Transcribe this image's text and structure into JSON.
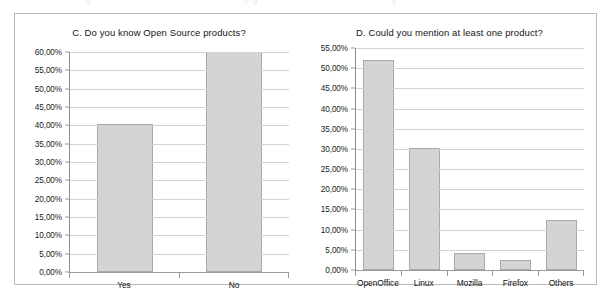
{
  "figure": {
    "cropped_top_fragments": [
      "g",
      "p g",
      "y"
    ]
  },
  "chart_data": [
    {
      "id": "chart-c",
      "type": "bar",
      "title": "C. Do you know Open Source products?",
      "xlabel": "",
      "ylabel": "",
      "categories": [
        "Yes",
        "No"
      ],
      "values": [
        40.5,
        60.0
      ],
      "value_labels": [
        "40,50%",
        "60,00%"
      ],
      "ylim": [
        0,
        60
      ],
      "ytick_step": 5,
      "ytick_labels": [
        "60,00%",
        "55,00%",
        "50,00%",
        "45,00%",
        "40,00%",
        "35,00%",
        "30,00%",
        "25,00%",
        "20,00%",
        "15,00%",
        "10,00%",
        "5,00%",
        "0,00%"
      ],
      "ytick_values": [
        60,
        55,
        50,
        45,
        40,
        35,
        30,
        25,
        20,
        15,
        10,
        5,
        0
      ],
      "grid": true,
      "legend": false,
      "bar_fill": "#d4d4d4",
      "bar_border": "#a9a9ad"
    },
    {
      "id": "chart-d",
      "type": "bar",
      "title": "D. Could you mention at least one product?",
      "xlabel": "",
      "ylabel": "",
      "categories": [
        "OpenOffice",
        "Linux",
        "Mozilla",
        "Firefox",
        "Others"
      ],
      "values": [
        52.0,
        30.2,
        4.1,
        2.6,
        12.5
      ],
      "value_labels": [
        "52,00%",
        "30,20%",
        "4,10%",
        "2,60%",
        "12,50%"
      ],
      "ylim": [
        0,
        55
      ],
      "ytick_step": 5,
      "ytick_labels": [
        "55,00%",
        "50,00%",
        "45,00%",
        "40,00%",
        "35,00%",
        "30,00%",
        "25,00%",
        "20,00%",
        "15,00%",
        "10,00%",
        "5,00%",
        "0,00%"
      ],
      "ytick_values": [
        55,
        50,
        45,
        40,
        35,
        30,
        25,
        20,
        15,
        10,
        5,
        0
      ],
      "grid": true,
      "legend": false,
      "bar_fill": "#d4d4d4",
      "bar_border": "#a9a9ad"
    }
  ]
}
